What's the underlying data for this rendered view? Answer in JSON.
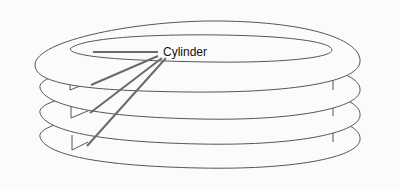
{
  "diagram": {
    "label": "Cylinder",
    "platter_count": 4,
    "colors": {
      "outline": "#555555",
      "pointer": "#6a6a6a",
      "background": "#fbfbfb"
    }
  }
}
